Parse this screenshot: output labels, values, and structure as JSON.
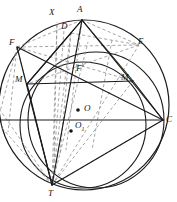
{
  "figure": {
    "type": "geometry-diagram",
    "width": 177,
    "height": 202,
    "background_color": "#ffffff",
    "stroke_color": "#1a1a1a",
    "dashed_stroke_color": "#8a8a8a"
  },
  "labels": {
    "X": "X",
    "A": "A",
    "D": "D",
    "F": "F",
    "E": "E",
    "M_left": "M",
    "M_right": "M",
    "F_prime": "F",
    "F_prime_mark": "'",
    "O": "O",
    "O1": "O",
    "O1_sub": "1",
    "C": "C",
    "T": "T"
  },
  "label_positions": {
    "X": {
      "x": 49,
      "y": 8
    },
    "A": {
      "x": 77,
      "y": 5
    },
    "D": {
      "x": 61,
      "y": 22
    },
    "F": {
      "x": 9,
      "y": 38
    },
    "E": {
      "x": 138,
      "y": 37
    },
    "M_left": {
      "x": 15,
      "y": 75
    },
    "M_right": {
      "x": 121,
      "y": 73
    },
    "F_prime": {
      "x": 76,
      "y": 64
    },
    "O": {
      "x": 84,
      "y": 104
    },
    "O1": {
      "x": 75,
      "y": 121
    },
    "C": {
      "x": 166,
      "y": 115
    },
    "T": {
      "x": 48,
      "y": 189
    }
  },
  "points": {
    "A": {
      "x": 82,
      "y": 20
    },
    "X": {
      "x": 57,
      "y": 24
    },
    "D": {
      "x": 71,
      "y": 33
    },
    "F": {
      "x": 17,
      "y": 47
    },
    "E": {
      "x": 139,
      "y": 45
    },
    "M_left": {
      "x": 27,
      "y": 84
    },
    "M_right": {
      "x": 133,
      "y": 81
    },
    "F_prime": {
      "x": 85,
      "y": 74
    },
    "O": {
      "x": 78,
      "y": 110
    },
    "O1": {
      "x": 71,
      "y": 131
    },
    "C": {
      "x": 163,
      "y": 120
    },
    "T": {
      "x": 52,
      "y": 185
    },
    "L": {
      "x": 0,
      "y": 120
    }
  },
  "circles": {
    "outer": {
      "cx": 84,
      "cy": 105,
      "r": 85,
      "style": "solid"
    },
    "inner": {
      "cx": 83,
      "cy": 125,
      "r": 63,
      "style": "solid"
    },
    "middle": {
      "cx": 96,
      "cy": 120,
      "r": 68,
      "style": "solid"
    }
  },
  "solid_segments": [
    {
      "from": "L",
      "to": "C",
      "name": "horizontal-diameter"
    },
    {
      "from": "M_left",
      "to": "M_right",
      "name": "m-m-chord"
    },
    {
      "from": "A",
      "to": "T",
      "name": "a-t"
    },
    {
      "from": "A",
      "to": "C",
      "name": "a-c"
    },
    {
      "from": "A",
      "to": "D",
      "name": "a-d"
    },
    {
      "from": "D",
      "to": "M_left",
      "name": "d-m-left"
    },
    {
      "from": "A",
      "to": "M_left",
      "name": "a-m-left"
    },
    {
      "from": "T",
      "to": "C",
      "name": "t-c"
    },
    {
      "from": "F",
      "to": "C",
      "name": "f-c"
    },
    {
      "from": "F",
      "to": "T",
      "name": "f-t"
    }
  ],
  "dashed_segments": [
    {
      "from": "F",
      "to": "E",
      "name": "f-e-chord"
    },
    {
      "from": "F",
      "to": "A",
      "name": "f-a"
    },
    {
      "from": "A",
      "to": "E",
      "name": "a-e"
    },
    {
      "from": "E",
      "to": "T",
      "name": "e-t"
    },
    {
      "from": "F",
      "to": "M_right",
      "name": "f-m-right"
    },
    {
      "from": "E",
      "to": "M_left",
      "name": "e-m-left"
    },
    {
      "from": "T",
      "to": "X",
      "name": "t-x"
    },
    {
      "from": "T",
      "to": "A",
      "name": "t-a-ray"
    },
    {
      "from": "T",
      "to": "D",
      "name": "t-d"
    },
    {
      "from": "T",
      "to": "F_prime",
      "name": "t-f-prime"
    },
    {
      "from": "T",
      "to": "F",
      "name": "t-f-dashed"
    },
    {
      "from": "T",
      "to": "M_right",
      "name": "t-m-right"
    },
    {
      "from": "T",
      "to": "E",
      "name": "t-e-dashed"
    },
    {
      "from": "X",
      "to": "T",
      "name": "x-t-vertical"
    },
    {
      "from": "D",
      "to": "E",
      "name": "d-e"
    },
    {
      "from": "F",
      "to": "L",
      "name": "f-left"
    }
  ],
  "dots": [
    {
      "name": "center-o-dot",
      "x": 78,
      "y": 110,
      "r": 1.8
    },
    {
      "name": "center-o1-dot",
      "x": 71,
      "y": 131,
      "r": 1.8
    }
  ]
}
